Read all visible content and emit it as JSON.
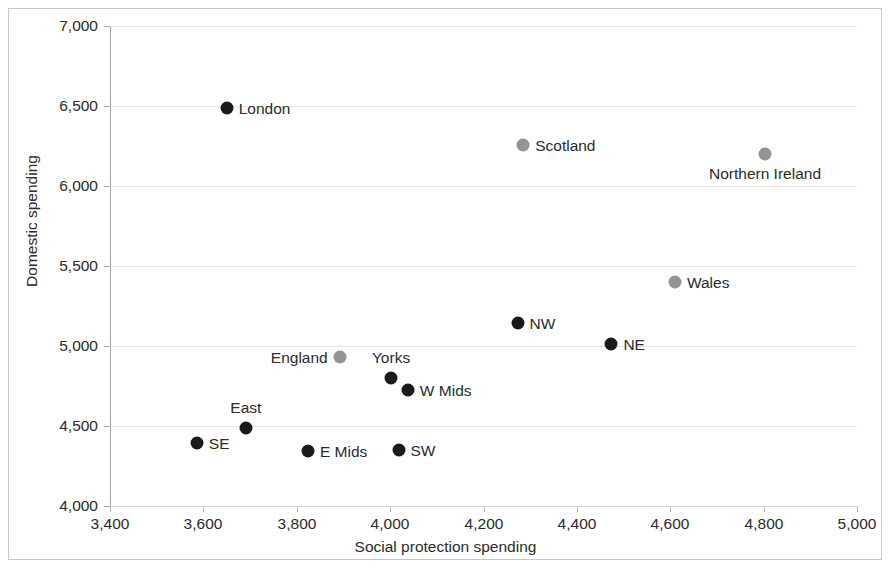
{
  "chart_data": {
    "type": "scatter",
    "title": "",
    "xlabel": "Social protection spending",
    "ylabel": "Domestic spending",
    "xlim": [
      3400,
      5000
    ],
    "ylim": [
      4000,
      7000
    ],
    "xticks": [
      "3,400",
      "3,600",
      "3,800",
      "4,000",
      "4,200",
      "4,400",
      "4,600",
      "4,800",
      "5,000"
    ],
    "xtick_values": [
      3400,
      3600,
      3800,
      4000,
      4200,
      4400,
      4600,
      4800,
      5000
    ],
    "yticks": [
      "7,000",
      "6,500",
      "6,000",
      "5,500",
      "5,000",
      "4,500",
      "4,000"
    ],
    "ytick_values": [
      7000,
      6500,
      6000,
      5500,
      5000,
      4500,
      4000
    ],
    "grid": true,
    "legend": "none",
    "colors": {
      "marker_dark": "#1a1a1a",
      "marker_grey": "#949494",
      "gridline": "#e3e3e3",
      "axis": "#a6a6a6",
      "text": "#2b2b2b",
      "frame": "#c9c9c9"
    },
    "points": [
      {
        "label": "London",
        "x": 3650,
        "y": 6488,
        "color": "dark",
        "label_pos": "right"
      },
      {
        "label": "Scotland",
        "x": 4285,
        "y": 6256,
        "color": "grey",
        "label_pos": "right"
      },
      {
        "label": "Northern Ireland",
        "x": 4803,
        "y": 6200,
        "color": "grey",
        "label_pos": "below"
      },
      {
        "label": "Wales",
        "x": 4610,
        "y": 5400,
        "color": "grey",
        "label_pos": "right"
      },
      {
        "label": "NW",
        "x": 4273,
        "y": 5144,
        "color": "dark",
        "label_pos": "right"
      },
      {
        "label": "NE",
        "x": 4474,
        "y": 5013,
        "color": "dark",
        "label_pos": "right"
      },
      {
        "label": "England",
        "x": 3892,
        "y": 4931,
        "color": "grey",
        "label_pos": "left"
      },
      {
        "label": "Yorks",
        "x": 4002,
        "y": 4800,
        "color": "dark",
        "label_pos": "above"
      },
      {
        "label": "W Mids",
        "x": 4038,
        "y": 4725,
        "color": "dark",
        "label_pos": "right"
      },
      {
        "label": "East",
        "x": 3691,
        "y": 4488,
        "color": "dark",
        "label_pos": "above"
      },
      {
        "label": "SE",
        "x": 3586,
        "y": 4394,
        "color": "dark",
        "label_pos": "right"
      },
      {
        "label": "E Mids",
        "x": 3824,
        "y": 4344,
        "color": "dark",
        "label_pos": "right"
      },
      {
        "label": "SW",
        "x": 4018,
        "y": 4350,
        "color": "dark",
        "label_pos": "right"
      }
    ]
  }
}
